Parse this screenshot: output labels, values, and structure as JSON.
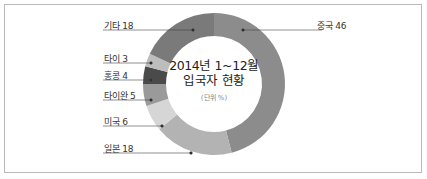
{
  "chart_data": {
    "type": "pie",
    "variant": "donut",
    "title": "2014년 1~12월 입국자 현황",
    "subtitle": "(단위 %)",
    "categories": [
      "중국",
      "일본",
      "미국",
      "타이완",
      "홍콩",
      "타이",
      "기타"
    ],
    "values": [
      46,
      18,
      6,
      5,
      4,
      3,
      18
    ],
    "colors": [
      "#8c8c8c",
      "#b3b3b3",
      "#d6d6d6",
      "#9a9a9a",
      "#4a4a4a",
      "#bdbdbd",
      "#7a7a7a"
    ],
    "start_angle_deg": 0,
    "direction": "clockwise",
    "legend_position": "leader-line labels"
  },
  "labels": {
    "china": "중국 46",
    "japan": "일본 18",
    "usa": "미국 6",
    "taiwan": "타이완 5",
    "hongkong": "홍콩 4",
    "thailand": "타이 3",
    "other": "기타 18"
  },
  "center": {
    "line1": "2014년 1~12월",
    "line2": "입국자 현황",
    "unit": "(단위 %)"
  }
}
